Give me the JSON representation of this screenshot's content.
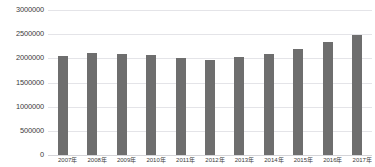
{
  "chart_data": {
    "type": "bar",
    "title": "",
    "xlabel": "",
    "ylabel": "",
    "categories": [
      "2007年",
      "2008年",
      "2009年",
      "2010年",
      "2011年",
      "2012年",
      "2013年",
      "2014年",
      "2015年",
      "2016年",
      "2017年"
    ],
    "values": [
      2050000,
      2120000,
      2090000,
      2060000,
      2010000,
      1960000,
      2020000,
      2090000,
      2200000,
      2330000,
      2480000
    ],
    "ylim": [
      0,
      3000000
    ],
    "ytick_labels": [
      "3000000",
      "2500000",
      "2000000",
      "1500000",
      "1000000",
      "500000",
      "0"
    ],
    "ytick_values": [
      3000000,
      2500000,
      2000000,
      1500000,
      1000000,
      500000,
      0
    ],
    "grid": true,
    "legend": false,
    "series_color": "#6e6e6e",
    "gridline_color": "#e4e4e8"
  }
}
